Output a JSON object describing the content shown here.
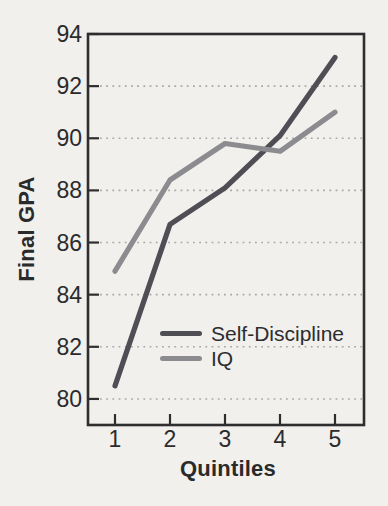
{
  "figure": {
    "background_color": "#f1f0ed",
    "ink_color": "#2b2b2b"
  },
  "chart_data": {
    "type": "line",
    "title": "",
    "xlabel": "Quintiles",
    "ylabel": "Final GPA",
    "x": [
      1,
      2,
      3,
      4,
      5
    ],
    "x_tick_labels": [
      "1",
      "2",
      "3",
      "4",
      "5"
    ],
    "y_ticks": [
      80,
      82,
      84,
      86,
      88,
      90,
      92,
      94
    ],
    "ylim": [
      79,
      94
    ],
    "xlim": [
      0.5,
      5.55
    ],
    "grid": "horizontal dotted gridlines at y ticks 80-92",
    "legend_position": "inside, lower middle of plot",
    "series": [
      {
        "name": "Self-Discipline",
        "color": "#4e4e54",
        "values": [
          80.5,
          86.7,
          88.1,
          90.1,
          93.1
        ]
      },
      {
        "name": "IQ",
        "color": "#8c8c90",
        "values": [
          84.9,
          88.4,
          89.8,
          89.5,
          91.0
        ]
      }
    ]
  }
}
